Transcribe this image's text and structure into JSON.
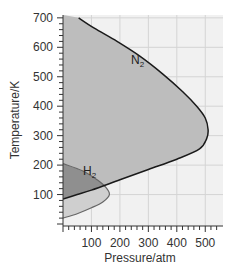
{
  "chart_data": {
    "type": "line",
    "title": "",
    "xlabel": "Pressure/atm",
    "ylabel": "Temperature/K",
    "xlim": [
      0,
      550
    ],
    "ylim": [
      0,
      710
    ],
    "xticks": [
      100,
      200,
      300,
      400,
      500
    ],
    "yticks": [
      100,
      200,
      300,
      400,
      500,
      600,
      700
    ],
    "grid": true,
    "legend": "inline labels",
    "series": [
      {
        "name": "N2",
        "label": "N",
        "subscript": "2",
        "fill": "#b9b9b9",
        "points": [
          [
            0,
            85
          ],
          [
            50,
            100
          ],
          [
            100,
            115
          ],
          [
            200,
            150
          ],
          [
            300,
            185
          ],
          [
            400,
            220
          ],
          [
            480,
            255
          ],
          [
            505,
            290
          ],
          [
            510,
            320
          ],
          [
            500,
            360
          ],
          [
            470,
            400
          ],
          [
            420,
            450
          ],
          [
            350,
            510
          ],
          [
            270,
            570
          ],
          [
            190,
            620
          ],
          [
            110,
            665
          ],
          [
            55,
            700
          ]
        ]
      },
      {
        "name": "H2",
        "label": "H",
        "subscript": "2",
        "fill": "#8f8f8f",
        "points": [
          [
            0,
            20
          ],
          [
            50,
            35
          ],
          [
            100,
            55
          ],
          [
            140,
            75
          ],
          [
            163,
            100
          ],
          [
            150,
            125
          ],
          [
            120,
            150
          ],
          [
            70,
            180
          ],
          [
            0,
            205
          ]
        ]
      }
    ]
  }
}
